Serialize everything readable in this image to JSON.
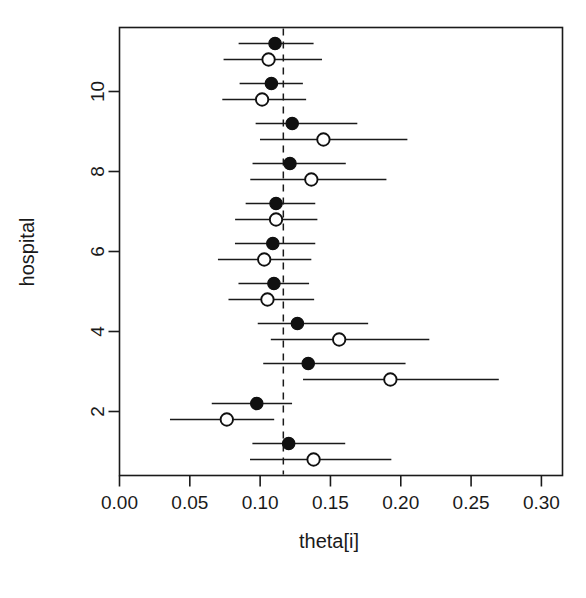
{
  "chart_data": {
    "type": "scatter",
    "title": "",
    "xlabel": "theta[i]",
    "ylabel": "hospital",
    "xlim": [
      0.0,
      0.315
    ],
    "ylim": [
      0.4,
      11.6
    ],
    "grid": false,
    "legend": null,
    "x_ticks": [
      0.0,
      0.05,
      0.1,
      0.15,
      0.2,
      0.25,
      0.3
    ],
    "x_tick_labels": [
      "0.00",
      "0.05",
      "0.10",
      "0.15",
      "0.20",
      "0.25",
      "0.30"
    ],
    "y_ticks": [
      2,
      4,
      6,
      8,
      10
    ],
    "y_tick_labels": [
      "2",
      "4",
      "6",
      "8",
      "10"
    ],
    "reference_line": {
      "orientation": "vertical",
      "value": 0.1165,
      "style": "dashed"
    },
    "marker_styles": {
      "filled": "solid black circle",
      "open": "open white circle"
    },
    "series": [
      {
        "name": "filled",
        "marker": "filled",
        "points": [
          {
            "hospital": 1,
            "estimate": 0.1203,
            "lower": 0.0945,
            "upper": 0.1605
          },
          {
            "hospital": 2,
            "estimate": 0.0976,
            "lower": 0.0656,
            "upper": 0.1227
          },
          {
            "hospital": 3,
            "estimate": 0.1342,
            "lower": 0.1022,
            "upper": 0.2034
          },
          {
            "hospital": 4,
            "estimate": 0.1265,
            "lower": 0.0983,
            "upper": 0.1768
          },
          {
            "hospital": 5,
            "estimate": 0.1098,
            "lower": 0.0846,
            "upper": 0.1348
          },
          {
            "hospital": 6,
            "estimate": 0.109,
            "lower": 0.0821,
            "upper": 0.1392
          },
          {
            "hospital": 7,
            "estimate": 0.1113,
            "lower": 0.0897,
            "upper": 0.1392
          },
          {
            "hospital": 8,
            "estimate": 0.1212,
            "lower": 0.0946,
            "upper": 0.1609
          },
          {
            "hospital": 9,
            "estimate": 0.1228,
            "lower": 0.0968,
            "upper": 0.1691
          },
          {
            "hospital": 10,
            "estimate": 0.108,
            "lower": 0.0854,
            "upper": 0.1304
          },
          {
            "hospital": 11,
            "estimate": 0.1106,
            "lower": 0.0847,
            "upper": 0.138
          }
        ]
      },
      {
        "name": "open",
        "marker": "open",
        "points": [
          {
            "hospital": 1,
            "estimate": 0.138,
            "lower": 0.0928,
            "upper": 0.1933
          },
          {
            "hospital": 2,
            "estimate": 0.0763,
            "lower": 0.0359,
            "upper": 0.11
          },
          {
            "hospital": 3,
            "estimate": 0.1926,
            "lower": 0.1305,
            "upper": 0.2697
          },
          {
            "hospital": 4,
            "estimate": 0.1562,
            "lower": 0.1076,
            "upper": 0.2203
          },
          {
            "hospital": 5,
            "estimate": 0.1052,
            "lower": 0.0775,
            "upper": 0.1384
          },
          {
            "hospital": 6,
            "estimate": 0.1029,
            "lower": 0.07,
            "upper": 0.1364
          },
          {
            "hospital": 7,
            "estimate": 0.1113,
            "lower": 0.0822,
            "upper": 0.1407
          },
          {
            "hospital": 8,
            "estimate": 0.1364,
            "lower": 0.093,
            "upper": 0.1898
          },
          {
            "hospital": 9,
            "estimate": 0.145,
            "lower": 0.0999,
            "upper": 0.2047
          },
          {
            "hospital": 10,
            "estimate": 0.1014,
            "lower": 0.0731,
            "upper": 0.1327
          },
          {
            "hospital": 11,
            "estimate": 0.106,
            "lower": 0.074,
            "upper": 0.144
          }
        ]
      }
    ]
  },
  "axis": {
    "x_title": "theta[i]",
    "y_title": "hospital"
  }
}
